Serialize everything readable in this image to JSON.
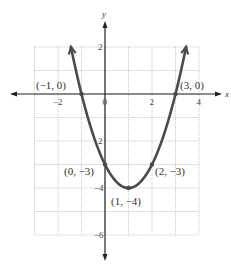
{
  "chart_data": {
    "type": "line",
    "title": "",
    "function": "y = x^2 - 2x - 3",
    "xlabel": "x",
    "ylabel": "y",
    "xlim": [
      -3,
      4
    ],
    "ylim": [
      -6,
      2
    ],
    "grid": true,
    "x_ticks": [
      {
        "value": -2,
        "label": "−2"
      },
      {
        "value": 0,
        "label": "0"
      },
      {
        "value": 2,
        "label": "2"
      },
      {
        "value": 4,
        "label": "4"
      }
    ],
    "y_ticks": [
      {
        "value": 2,
        "label": "2"
      },
      {
        "value": -2,
        "label": "2"
      },
      {
        "value": -4,
        "label": "−4"
      },
      {
        "value": -6,
        "label": "−6"
      }
    ],
    "points": [
      {
        "x": -1,
        "y": 0,
        "label": "(−1, 0)"
      },
      {
        "x": 3,
        "y": 0,
        "label": "(3, 0)"
      },
      {
        "x": 0,
        "y": -3,
        "label": "(0, −3)"
      },
      {
        "x": 2,
        "y": -3,
        "label": "(2, −3)"
      },
      {
        "x": 1,
        "y": -4,
        "label": "(1, −4)"
      }
    ],
    "series": [
      {
        "name": "parabola",
        "x": [
          -1.45,
          -1,
          0,
          1,
          2,
          3,
          3.45
        ],
        "values": [
          2,
          0,
          -3,
          -4,
          -3,
          0,
          2
        ]
      }
    ]
  },
  "colors": {
    "curve": "#4a4a4a",
    "axis": "#222222",
    "grid": "#b8b8b8"
  }
}
